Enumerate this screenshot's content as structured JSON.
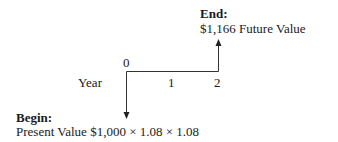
{
  "end": {
    "label": "End:",
    "value_text": "$1,166 Future Value"
  },
  "begin": {
    "label": "Begin:",
    "value_text": "Present Value $1,000 × 1.08 × 1.08"
  },
  "timeline": {
    "axis_label": "Year",
    "ticks": [
      "0",
      "1",
      "2"
    ]
  },
  "arrows": {
    "year0": "down",
    "year2": "up"
  },
  "colors": {
    "text": "#1a1a1a",
    "line": "#333333",
    "background": "#ffffff"
  }
}
